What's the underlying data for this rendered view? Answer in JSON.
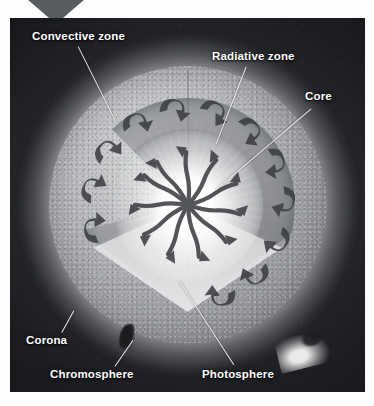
{
  "figure": {
    "type": "labeled-photo-diagram"
  },
  "labels": [
    {
      "id": "convective-zone",
      "text": "Convective zone",
      "x": 32,
      "y": 30,
      "leader": {
        "x1": 78,
        "y1": 46,
        "x2": 116,
        "y2": 122
      }
    },
    {
      "id": "radiative-zone",
      "text": "Radiative zone",
      "x": 212,
      "y": 50,
      "leader": {
        "x1": 246,
        "y1": 66,
        "x2": 216,
        "y2": 143
      }
    },
    {
      "id": "core",
      "text": "Core",
      "x": 305,
      "y": 90,
      "leader": {
        "x1": 311,
        "y1": 108,
        "x2": 216,
        "y2": 189
      }
    },
    {
      "id": "corona",
      "text": "Corona",
      "x": 26,
      "y": 334,
      "leader": {
        "x1": 62,
        "y1": 332,
        "x2": 74,
        "y2": 310
      }
    },
    {
      "id": "chromosphere",
      "text": "Chromosphere",
      "x": 50,
      "y": 368,
      "leader": {
        "x1": 115,
        "y1": 366,
        "x2": 133,
        "y2": 340
      }
    },
    {
      "id": "photosphere",
      "text": "Photosphere",
      "x": 202,
      "y": 368,
      "leader": {
        "x1": 234,
        "y1": 364,
        "x2": 180,
        "y2": 281
      }
    }
  ],
  "features": [
    {
      "id": "sunspot",
      "name": "sunspot-marking"
    },
    {
      "id": "prominence",
      "name": "solar-prominence-marking"
    }
  ],
  "colors": {
    "label_text": "#ffffff",
    "leader_line": "#f4f4f4",
    "corner_triangle": "#585c60",
    "photosphere": "#a3a5a8",
    "convective_band": "#9a9c9f",
    "radiative_zone": "#cfd1d2",
    "core": "#ffffff",
    "space": "#1b1c1f"
  }
}
